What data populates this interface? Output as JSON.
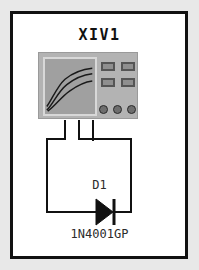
{
  "document": {
    "kind": "circuit-schematic",
    "background_color": "#e8e8e8",
    "sheet_color": "#ffffff",
    "border_color": "#111111"
  },
  "instrument": {
    "name": "XIV1",
    "type": "iv-analyzer",
    "body_color": "#b3b3b3",
    "screen_color": "#a0a0a0",
    "screen_bezel_color": "#d8d8d8",
    "trace_color": "#1a1a1a",
    "traces": [
      "M2,52 C8,44 13,30 22,22 C32,14 42,11 52,10",
      "M2,56 C9,49 14,36 24,28 C34,20 43,17 52,16",
      "M3,57 C11,52 17,42 27,35 C37,28 44,25 52,24"
    ],
    "readouts": [
      {
        "id": "readout-1",
        "color": "#8f8f8f",
        "border": "#555555"
      },
      {
        "id": "readout-2",
        "color": "#8f8f8f",
        "border": "#555555"
      },
      {
        "id": "readout-3",
        "color": "#8f8f8f",
        "border": "#555555"
      },
      {
        "id": "readout-4",
        "color": "#8f8f8f",
        "border": "#555555"
      }
    ],
    "terminals": [
      {
        "id": "terminal-1",
        "fill": "#6e6e6e",
        "stroke": "#2a2a2a"
      },
      {
        "id": "terminal-2",
        "fill": "#6e6e6e",
        "stroke": "#2a2a2a"
      },
      {
        "id": "terminal-3",
        "fill": "#6e6e6e",
        "stroke": "#2a2a2a"
      }
    ]
  },
  "component": {
    "designator": "D1",
    "part_number": "1N4001GP",
    "type": "diode",
    "symbol_color": "#111111",
    "orientation": "anode-left-cathode-right"
  },
  "wiring": {
    "color": "#111111",
    "width": 2,
    "nets": [
      {
        "id": "net-terminal1-anode",
        "from": "terminal-1",
        "to": "diode-anode",
        "path": "M65,120 L65,139 L47,139 L47,212 L96,212"
      },
      {
        "id": "net-terminal2-cathode",
        "from": "terminal-2",
        "to": "diode-cathode",
        "path": "M79,120 L79,139 L131,139 L131,212 L113,212"
      },
      {
        "id": "net-terminal3-stub",
        "from": "terminal-3",
        "to": "open",
        "path": "M93,120 L93,141"
      }
    ]
  }
}
